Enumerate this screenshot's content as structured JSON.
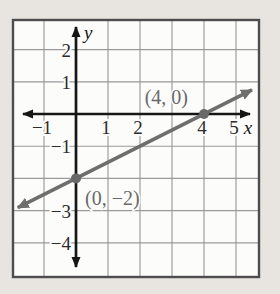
{
  "page": {
    "background_color": "#e9e6e2",
    "plot_background": "#fcfcfb"
  },
  "chart_data": {
    "type": "line",
    "title": "",
    "xlabel": "x",
    "ylabel": "y",
    "grid": true,
    "xlim": [
      -2,
      5.7
    ],
    "ylim": [
      -5.05,
      2.95
    ],
    "x_tick_values": [
      -1,
      1,
      2,
      4,
      5
    ],
    "x_tick_labels": [
      "−1",
      "1",
      "2",
      "4",
      "5"
    ],
    "y_tick_values": [
      2,
      1,
      -1,
      -3,
      -4
    ],
    "y_tick_labels": [
      "2",
      "1",
      "−1",
      "−3",
      "−4"
    ],
    "grid_x_values": [
      -1,
      1,
      2,
      3,
      4,
      5
    ],
    "grid_y_values": [
      2,
      1,
      -1,
      -2,
      -3,
      -4
    ],
    "series": [
      {
        "name": "line-through-points",
        "slope": 0.5,
        "y_intercept": -2,
        "draw_from_x": -1.82,
        "draw_to_x": 5.5,
        "points": [
          {
            "x": 4,
            "y": 0,
            "label": "(4, 0)",
            "label_pos": "above-left"
          },
          {
            "x": 0,
            "y": -2,
            "label": "(0, −2)",
            "label_pos": "below-right"
          }
        ]
      }
    ],
    "colors": {
      "axis": "#161616",
      "grid": "#9a9a9a",
      "border": "#4d4d4d",
      "line": "#6e6e6e",
      "point": "#686868",
      "tick_text": "#2b2b2b",
      "coord_label_text": "#696969"
    }
  }
}
